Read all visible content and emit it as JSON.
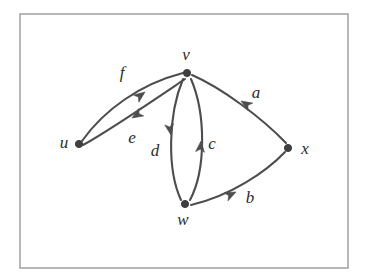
{
  "figure": {
    "type": "directed-multigraph",
    "caption": "",
    "background_color": "#ffffff",
    "frame": {
      "stroke_color": "#9a9a9a",
      "x": 20,
      "y": 14,
      "width": 328,
      "height": 254
    },
    "style": {
      "edge_color": "#4d4d4d",
      "vertex_color": "#3f3f3f",
      "label_color": "#2b2b2b"
    }
  },
  "vertices": [
    {
      "id": "u",
      "label": "u",
      "x": 79,
      "y": 144,
      "label_x": 64,
      "label_y": 144
    },
    {
      "id": "v",
      "label": "v",
      "x": 187,
      "y": 73,
      "label_x": 186,
      "label_y": 56
    },
    {
      "id": "w",
      "label": "w",
      "x": 185,
      "y": 204,
      "label_x": 183,
      "label_y": 221
    },
    {
      "id": "x",
      "label": "x",
      "x": 288,
      "y": 148,
      "label_x": 305,
      "label_y": 150
    }
  ],
  "edges": [
    {
      "id": "f",
      "label": "f",
      "from": "u",
      "to": "v",
      "label_x": 122,
      "label_y": 74
    },
    {
      "id": "e",
      "label": "e",
      "from": "v",
      "to": "u",
      "label_x": 132,
      "label_y": 139
    },
    {
      "id": "d",
      "label": "d",
      "from": "v",
      "to": "w",
      "label_x": 155,
      "label_y": 152
    },
    {
      "id": "c",
      "label": "c",
      "from": "w",
      "to": "v",
      "label_x": 212,
      "label_y": 145
    },
    {
      "id": "a",
      "label": "a",
      "from": "x",
      "to": "v",
      "label_x": 256,
      "label_y": 94
    },
    {
      "id": "b",
      "label": "b",
      "from": "w",
      "to": "x",
      "label_x": 250,
      "label_y": 199
    }
  ],
  "geometry": {
    "paths": {
      "f": "M 82 141 C 104 110 140 84 183 73",
      "e": "M 185 79 C 148 104 110 130 83 145",
      "d": "M 183 79 C 168 115 167 170 181 200",
      "c": "M 190 200 C 206 170 206 114 191 79",
      "a": "M 286 143 C 262 118 222 88 192 75",
      "b": "M 191 205 C 230 196 266 172 285 152"
    },
    "arrows": {
      "f": {
        "x": 145,
        "y": 92,
        "angle": -37
      },
      "e": {
        "x": 132,
        "y": 118,
        "angle": 148
      },
      "d": {
        "x": 171,
        "y": 135,
        "angle": 80
      },
      "c": {
        "x": 201,
        "y": 141,
        "angle": -85
      },
      "a": {
        "x": 241,
        "y": 101,
        "angle": -148
      },
      "b": {
        "x": 236,
        "y": 192,
        "angle": -26
      }
    }
  }
}
